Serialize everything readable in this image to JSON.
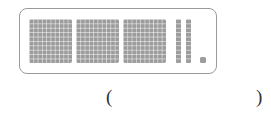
{
  "figure": {
    "hundreds_count": 3,
    "tens_count": 2,
    "ones_count": 1,
    "block_color": "#9c9c9c",
    "frame_color": "#9a9a9a"
  },
  "answer_blank": {
    "open_paren": "(",
    "close_paren": ")",
    "value": ""
  }
}
